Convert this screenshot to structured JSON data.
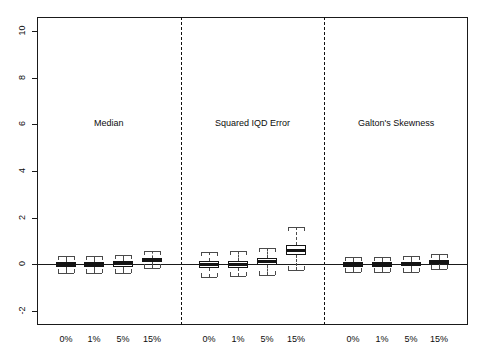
{
  "figure": {
    "background": "#ffffff",
    "frame_color": "#1a1a1a",
    "separator_color": "#111111"
  },
  "chart_data": {
    "type": "box",
    "title": "",
    "xlabel": "",
    "ylabel": "",
    "ylim": [
      -2.6,
      10.6
    ],
    "grid": false,
    "legend": null,
    "yticks": [
      -2,
      0,
      2,
      4,
      6,
      8,
      10
    ],
    "ytick_labels": [
      "-2",
      "0",
      "2",
      "4",
      "6",
      "8",
      "10"
    ],
    "categories": [
      "0%",
      "1%",
      "5%",
      "15%"
    ],
    "reference_line": 0,
    "panel_label_y": 6,
    "panels": [
      {
        "label": "Median",
        "boxes": [
          {
            "category": "0%",
            "whisker_low": -0.36,
            "q1": -0.11,
            "median": -0.01,
            "q3": 0.1,
            "whisker_high": 0.34
          },
          {
            "category": "1%",
            "whisker_low": -0.38,
            "q1": -0.12,
            "median": -0.01,
            "q3": 0.11,
            "whisker_high": 0.36
          },
          {
            "category": "5%",
            "whisker_low": -0.36,
            "q1": -0.11,
            "median": 0.03,
            "q3": 0.14,
            "whisker_high": 0.4
          },
          {
            "category": "15%",
            "whisker_low": -0.14,
            "q1": 0.1,
            "median": 0.19,
            "q3": 0.29,
            "whisker_high": 0.56
          }
        ]
      },
      {
        "label": "Squared IQD Error",
        "boxes": [
          {
            "category": "0%",
            "whisker_low": -0.56,
            "q1": -0.16,
            "median": -0.02,
            "q3": 0.13,
            "whisker_high": 0.52
          },
          {
            "category": "1%",
            "whisker_low": -0.52,
            "q1": -0.15,
            "median": -0.01,
            "q3": 0.15,
            "whisker_high": 0.56
          },
          {
            "category": "5%",
            "whisker_low": -0.44,
            "q1": -0.04,
            "median": 0.11,
            "q3": 0.26,
            "whisker_high": 0.7
          },
          {
            "category": "15%",
            "whisker_low": -0.26,
            "q1": 0.38,
            "median": 0.6,
            "q3": 0.84,
            "whisker_high": 1.58
          }
        ]
      },
      {
        "label": "Galton's Skewness",
        "boxes": [
          {
            "category": "0%",
            "whisker_low": -0.34,
            "q1": -0.11,
            "median": -0.01,
            "q3": 0.09,
            "whisker_high": 0.32
          },
          {
            "category": "1%",
            "whisker_low": -0.34,
            "q1": -0.11,
            "median": -0.01,
            "q3": 0.09,
            "whisker_high": 0.32
          },
          {
            "category": "5%",
            "whisker_low": -0.33,
            "q1": -0.08,
            "median": 0.01,
            "q3": 0.11,
            "whisker_high": 0.34
          },
          {
            "category": "15%",
            "whisker_low": -0.22,
            "q1": 0.02,
            "median": 0.1,
            "q3": 0.2,
            "whisker_high": 0.44
          }
        ]
      }
    ]
  }
}
